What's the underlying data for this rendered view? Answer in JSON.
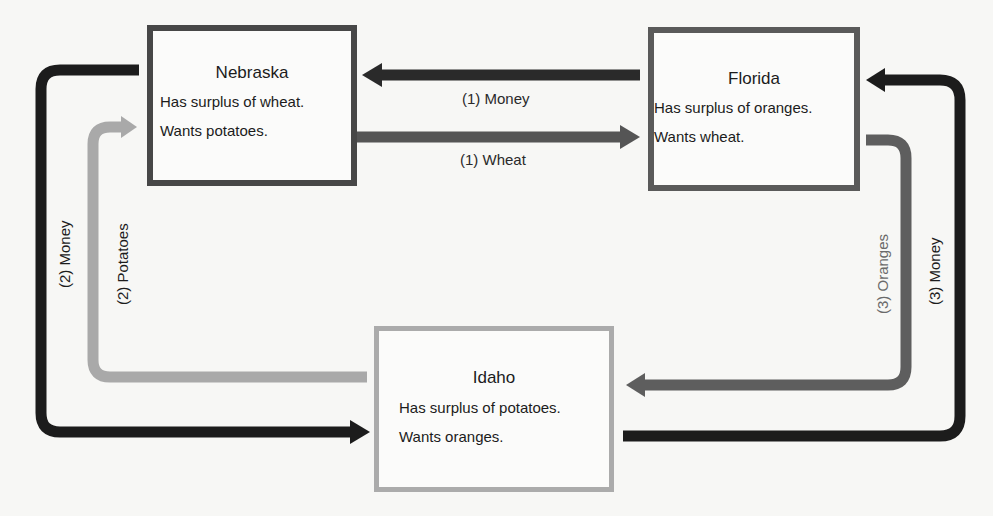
{
  "diagram": {
    "type": "barter-trade-cycle",
    "nodes": {
      "nebraska": {
        "name": "Nebraska",
        "surplus": "Has surplus of wheat.",
        "wants": "Wants potatoes."
      },
      "florida": {
        "name": "Florida",
        "surplus": "Has surplus of oranges.",
        "wants": "Wants wheat."
      },
      "idaho": {
        "name": "Idaho",
        "surplus": "Has surplus of potatoes.",
        "wants": "Wants oranges."
      }
    },
    "flows": [
      {
        "id": "money-1",
        "label": "(1) Money",
        "from": "Florida",
        "to": "Nebraska",
        "color": "#2a2a2a"
      },
      {
        "id": "wheat-1",
        "label": "(1) Wheat",
        "from": "Nebraska",
        "to": "Florida",
        "color": "#555555"
      },
      {
        "id": "money-2",
        "label": "(2) Money",
        "from": "Nebraska",
        "to": "Idaho",
        "color": "#1c1c1c"
      },
      {
        "id": "potatoes-2",
        "label": "(2) Potatoes",
        "from": "Idaho",
        "to": "Nebraska",
        "color": "#a9a9a9"
      },
      {
        "id": "oranges-3",
        "label": "(3) Oranges",
        "from": "Florida",
        "to": "Idaho",
        "color": "#5e5e5e"
      },
      {
        "id": "money-3",
        "label": "(3) Money",
        "from": "Idaho",
        "to": "Florida",
        "color": "#1c1c1c"
      }
    ]
  }
}
